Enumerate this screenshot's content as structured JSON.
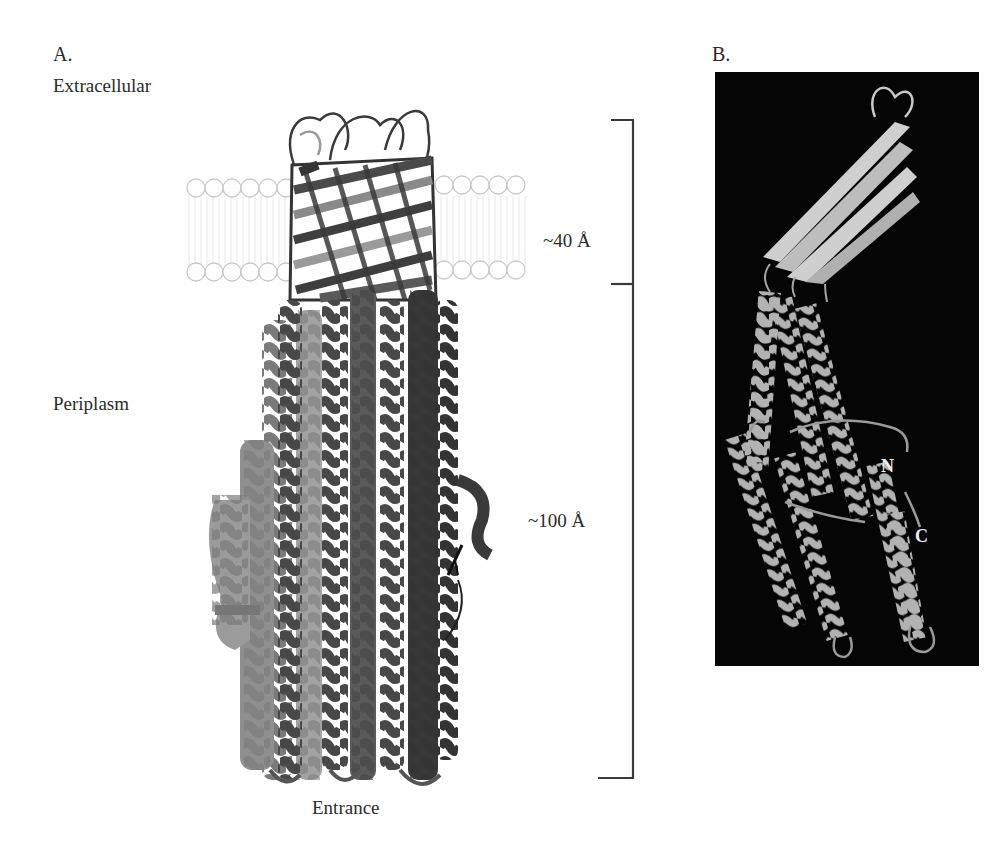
{
  "figure": {
    "panel_a": {
      "letter": "A.",
      "labels": {
        "top_region": "Extracellular",
        "middle_region": "Periplasm",
        "bottom": "Entrance"
      },
      "dimensions": {
        "membrane_domain": "~40 Å",
        "periplasmic_domain": "~100 Å"
      },
      "structure": {
        "description": "Trimeric protein channel: beta-barrel spanning the outer membrane above a long alpha-helical periplasmic tunnel",
        "membrane_bilayer": "lipid head groups drawn as circles",
        "subunit_colors": [
          "#9a9a9a",
          "#5c5c5c",
          "#3e3e3e"
        ]
      }
    },
    "panel_b": {
      "letter": "B.",
      "background": "#050505",
      "structure": {
        "description": "Single monomer ribbon: four-stranded beta-sheet on top, alpha-helical coiled coils below",
        "color": "#a8a8a8"
      },
      "termini": {
        "n_label": "N",
        "c_label": "C"
      }
    }
  }
}
